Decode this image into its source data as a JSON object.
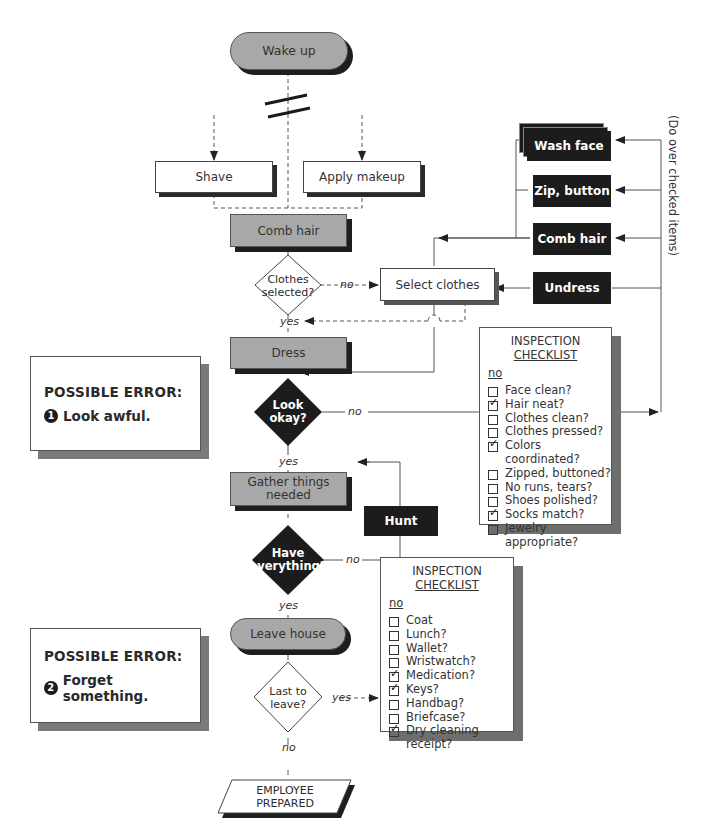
{
  "flowchart": {
    "start": "Wake up",
    "shave": "Shave",
    "apply_makeup": "Apply makeup",
    "comb_hair": "Comb hair",
    "decision_clothes": "Clothes selected?",
    "decision_clothes_lines": [
      "Clothes",
      "selected?"
    ],
    "select_clothes": "Select clothes",
    "dress": "Dress",
    "decision_look": [
      "Look",
      "okay?"
    ],
    "gather": [
      "Gather things",
      "needed"
    ],
    "hunt": "Hunt",
    "decision_have": [
      "Have",
      "everything?"
    ],
    "leave_house": "Leave house",
    "decision_last": [
      "Last to",
      "leave?"
    ],
    "end": [
      "EMPLOYEE",
      "PREPARED"
    ],
    "labels": {
      "no": "no",
      "yes": "yes"
    }
  },
  "rework": {
    "items": [
      "Wash face",
      "Zip, button",
      "Comb hair",
      "Undress"
    ],
    "side_note": "(Do over checked items)"
  },
  "checklist_1": {
    "title_line1": "INSPECTION",
    "title_line2": "CHECKLIST",
    "header": "no",
    "items": [
      {
        "label": "Face clean?",
        "checked": false
      },
      {
        "label": "Hair neat?",
        "checked": true
      },
      {
        "label": "Clothes clean?",
        "checked": false
      },
      {
        "label": "Clothes pressed?",
        "checked": false
      },
      {
        "label": "Colors coordinated?",
        "checked": true
      },
      {
        "label": "Zipped, buttoned?",
        "checked": false
      },
      {
        "label": "No runs, tears?",
        "checked": false
      },
      {
        "label": "Shoes polished?",
        "checked": false
      },
      {
        "label": "Socks match?",
        "checked": true
      },
      {
        "label": "Jewelry appropriate?",
        "checked": false
      }
    ]
  },
  "checklist_2": {
    "title_line1": "INSPECTION",
    "title_line2": "CHECKLIST",
    "header": "no",
    "items": [
      {
        "label": "Coat",
        "checked": false
      },
      {
        "label": "Lunch?",
        "checked": false
      },
      {
        "label": "Wallet?",
        "checked": false
      },
      {
        "label": "Wristwatch?",
        "checked": false
      },
      {
        "label": "Medication?",
        "checked": true
      },
      {
        "label": "Keys?",
        "checked": true
      },
      {
        "label": "Handbag?",
        "checked": false
      },
      {
        "label": "Briefcase?",
        "checked": false
      },
      {
        "label": "Dry cleaning receipt?",
        "checked": true,
        "lines": [
          "Dry cleaning",
          "receipt?"
        ]
      }
    ]
  },
  "errors": [
    {
      "title": "POSSIBLE ERROR:",
      "number": "1",
      "text": "Look awful."
    },
    {
      "title": "POSSIBLE ERROR:",
      "number": "2",
      "text": "Forget something."
    }
  ]
}
